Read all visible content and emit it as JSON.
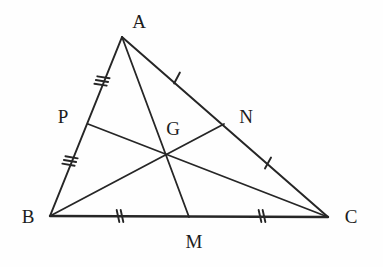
{
  "figure": {
    "background_color": "#fefefe",
    "stroke_color": "#262626",
    "label_color": "#1c1c1c",
    "width": 383,
    "height": 267
  },
  "points": {
    "A": {
      "label": "A",
      "x": 122,
      "y": 37,
      "label_x": 139,
      "label_y": 21
    },
    "B": {
      "label": "B",
      "x": 50,
      "y": 216,
      "label_x": 28,
      "label_y": 216
    },
    "C": {
      "label": "C",
      "x": 328,
      "y": 217,
      "label_x": 351,
      "label_y": 216
    },
    "P": {
      "label": "P",
      "x": 88,
      "y": 124,
      "label_x": 63,
      "label_y": 116
    },
    "N": {
      "label": "N",
      "x": 224,
      "y": 124,
      "label_x": 246,
      "label_y": 116
    },
    "M": {
      "label": "M",
      "x": 189,
      "y": 217,
      "label_x": 194,
      "label_y": 241
    },
    "G": {
      "label": "G",
      "x": 166,
      "y": 156,
      "label_x": 173,
      "label_y": 128
    }
  },
  "sides": [
    {
      "name": "side-ab",
      "from": "A",
      "to": "B"
    },
    {
      "name": "side-ac",
      "from": "A",
      "to": "C"
    },
    {
      "name": "side-bc",
      "from": "B",
      "to": "C"
    }
  ],
  "medians": [
    {
      "name": "median-am",
      "from": "A",
      "to": "M"
    },
    {
      "name": "median-bn",
      "from": "B",
      "to": "N"
    },
    {
      "name": "median-cp",
      "from": "C",
      "to": "P"
    }
  ],
  "tick_marks": [
    {
      "name": "tick-ap",
      "segment": "AP",
      "count": 3,
      "x": 102,
      "y": 81
    },
    {
      "name": "tick-pb",
      "segment": "PB",
      "count": 3,
      "x": 70,
      "y": 161
    },
    {
      "name": "tick-an",
      "segment": "AN",
      "count": 1,
      "x": 177,
      "y": 78
    },
    {
      "name": "tick-nc",
      "segment": "NC",
      "count": 1,
      "x": 268,
      "y": 163
    },
    {
      "name": "tick-bm",
      "segment": "BM",
      "count": 2,
      "x": 120,
      "y": 216
    },
    {
      "name": "tick-mc",
      "segment": "MC",
      "count": 2,
      "x": 262,
      "y": 216
    }
  ]
}
